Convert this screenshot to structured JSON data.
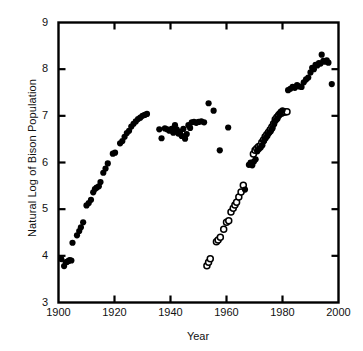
{
  "chart_data": {
    "type": "scatter",
    "title": "",
    "xlabel": "Year",
    "ylabel": "Natural Log of Bison Population",
    "xlim": [
      1900,
      2000
    ],
    "ylim": [
      3,
      9
    ],
    "xticks": [
      1900,
      1920,
      1940,
      1960,
      1980,
      2000
    ],
    "yticks": [
      3,
      4,
      5,
      6,
      7,
      8,
      9
    ],
    "grid": false,
    "legend": "none",
    "marker_colors": {
      "filled": "#000000",
      "open_stroke": "#000000",
      "open_fill": "#ffffff",
      "axis": "#000000",
      "background": "#ffffff"
    },
    "series": [
      {
        "name": "filled-circles",
        "marker": "filled-circle",
        "points": [
          [
            1901,
            3.93
          ],
          [
            1902,
            3.78
          ],
          [
            1902.6,
            3.86
          ],
          [
            1903,
            3.87
          ],
          [
            1903.6,
            3.89
          ],
          [
            1904,
            3.91
          ],
          [
            1904.6,
            3.9
          ],
          [
            1905,
            4.28
          ],
          [
            1906.6,
            4.44
          ],
          [
            1907.4,
            4.53
          ],
          [
            1908,
            4.61
          ],
          [
            1908.8,
            4.72
          ],
          [
            1910,
            5.08
          ],
          [
            1910.8,
            5.13
          ],
          [
            1911.6,
            5.2
          ],
          [
            1912.4,
            5.36
          ],
          [
            1913,
            5.43
          ],
          [
            1913.6,
            5.46
          ],
          [
            1914.4,
            5.49
          ],
          [
            1915,
            5.58
          ],
          [
            1916,
            5.78
          ],
          [
            1916.8,
            5.87
          ],
          [
            1917.6,
            5.98
          ],
          [
            1919.4,
            6.19
          ],
          [
            1920.2,
            6.21
          ],
          [
            1922,
            6.41
          ],
          [
            1922.8,
            6.46
          ],
          [
            1923.6,
            6.55
          ],
          [
            1924.4,
            6.63
          ],
          [
            1925.2,
            6.68
          ],
          [
            1926,
            6.77
          ],
          [
            1926.8,
            6.83
          ],
          [
            1927.6,
            6.88
          ],
          [
            1928.4,
            6.93
          ],
          [
            1929.2,
            6.96
          ],
          [
            1930,
            7.0
          ],
          [
            1930.8,
            7.02
          ],
          [
            1931.6,
            7.04
          ],
          [
            1936,
            6.71
          ],
          [
            1936.8,
            6.52
          ],
          [
            1938,
            6.73
          ],
          [
            1938.8,
            6.71
          ],
          [
            1939.6,
            6.68
          ],
          [
            1940.4,
            6.72
          ],
          [
            1941,
            6.64
          ],
          [
            1941.6,
            6.8
          ],
          [
            1942.2,
            6.71
          ],
          [
            1942.8,
            6.62
          ],
          [
            1943.4,
            6.66
          ],
          [
            1944,
            6.57
          ],
          [
            1944.6,
            6.72
          ],
          [
            1945.2,
            6.51
          ],
          [
            1945.8,
            6.61
          ],
          [
            1946.4,
            6.8
          ],
          [
            1947,
            6.74
          ],
          [
            1947.6,
            6.86
          ],
          [
            1948.4,
            6.87
          ],
          [
            1949.2,
            6.85
          ],
          [
            1950,
            6.87
          ],
          [
            1951,
            6.88
          ],
          [
            1952,
            6.86
          ],
          [
            1953.6,
            7.27
          ],
          [
            1955.4,
            7.11
          ],
          [
            1957.6,
            6.26
          ],
          [
            1960.6,
            6.75
          ],
          [
            1966.6,
            5.42
          ],
          [
            1968,
            5.95
          ],
          [
            1968.6,
            6.0
          ],
          [
            1969.2,
            5.94
          ],
          [
            1969.8,
            6.02
          ],
          [
            1970.4,
            6.07
          ],
          [
            1971,
            6.24
          ],
          [
            1971.6,
            6.29
          ],
          [
            1972.2,
            6.32
          ],
          [
            1972.8,
            6.37
          ],
          [
            1973.4,
            6.46
          ],
          [
            1974,
            6.52
          ],
          [
            1974.6,
            6.57
          ],
          [
            1975.2,
            6.63
          ],
          [
            1975.8,
            6.67
          ],
          [
            1976.4,
            6.73
          ],
          [
            1977,
            6.83
          ],
          [
            1977.6,
            6.9
          ],
          [
            1978.2,
            6.94
          ],
          [
            1978.8,
            7.04
          ],
          [
            1979.4,
            7.09
          ],
          [
            1980,
            7.12
          ],
          [
            1982,
            7.55
          ],
          [
            1982.8,
            7.58
          ],
          [
            1983.6,
            7.62
          ],
          [
            1984.4,
            7.6
          ],
          [
            1985.2,
            7.66
          ],
          [
            1986,
            7.63
          ],
          [
            1986.8,
            7.62
          ],
          [
            1987.6,
            7.72
          ],
          [
            1988.4,
            7.78
          ],
          [
            1989.2,
            7.82
          ],
          [
            1990,
            7.93
          ],
          [
            1990.6,
            8.03
          ],
          [
            1991.2,
            8.0
          ],
          [
            1991.8,
            8.09
          ],
          [
            1992.4,
            8.08
          ],
          [
            1993,
            8.13
          ],
          [
            1993.6,
            8.12
          ],
          [
            1994,
            8.31
          ],
          [
            1994.6,
            8.18
          ],
          [
            1995.2,
            8.16
          ],
          [
            1995.8,
            8.19
          ],
          [
            1996.4,
            8.14
          ],
          [
            1997.6,
            7.68
          ]
        ]
      },
      {
        "name": "open-circles",
        "marker": "open-circle",
        "points": [
          [
            1953,
            3.79
          ],
          [
            1953.6,
            3.86
          ],
          [
            1954.2,
            3.94
          ],
          [
            1956.4,
            4.3
          ],
          [
            1957,
            4.34
          ],
          [
            1957.8,
            4.4
          ],
          [
            1959,
            4.57
          ],
          [
            1960,
            4.72
          ],
          [
            1960.8,
            4.75
          ],
          [
            1961.6,
            4.94
          ],
          [
            1962.4,
            5.02
          ],
          [
            1963,
            5.09
          ],
          [
            1963.6,
            5.15
          ],
          [
            1964.4,
            5.26
          ],
          [
            1965.2,
            5.37
          ],
          [
            1966,
            5.51
          ],
          [
            1969.6,
            6.18
          ],
          [
            1970.2,
            6.26
          ],
          [
            1970.8,
            6.3
          ],
          [
            1971.4,
            6.34
          ],
          [
            1972,
            6.36
          ],
          [
            1972.6,
            6.43
          ],
          [
            1973.2,
            6.48
          ],
          [
            1973.8,
            6.55
          ],
          [
            1974.4,
            6.6
          ],
          [
            1975,
            6.65
          ],
          [
            1975.6,
            6.7
          ],
          [
            1976.2,
            6.76
          ],
          [
            1976.8,
            6.83
          ],
          [
            1977.4,
            6.92
          ],
          [
            1978,
            6.97
          ],
          [
            1978.6,
            7.01
          ],
          [
            1979.2,
            7.05
          ],
          [
            1979.8,
            7.06
          ],
          [
            1980.4,
            7.08
          ],
          [
            1981,
            7.08
          ],
          [
            1981.6,
            7.09
          ]
        ]
      }
    ]
  }
}
